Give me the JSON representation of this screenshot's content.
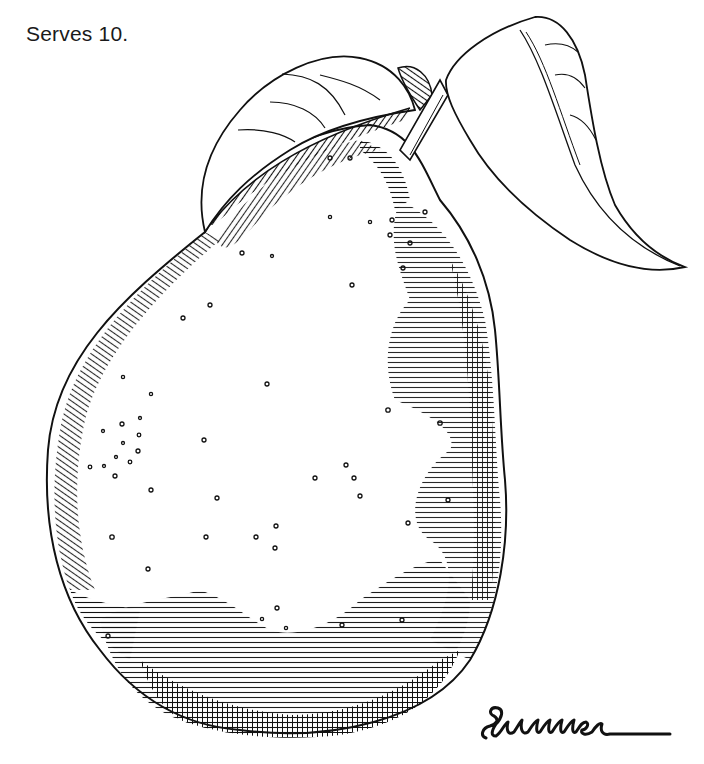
{
  "caption": {
    "serves": "Serves 10."
  },
  "illustration": {
    "subject": "pear-with-two-leaves",
    "style": "pen-and-ink crosshatch",
    "ink_color": "#111111",
    "paper_color": "#ffffff"
  },
  "signature": {
    "text": "Summer"
  }
}
